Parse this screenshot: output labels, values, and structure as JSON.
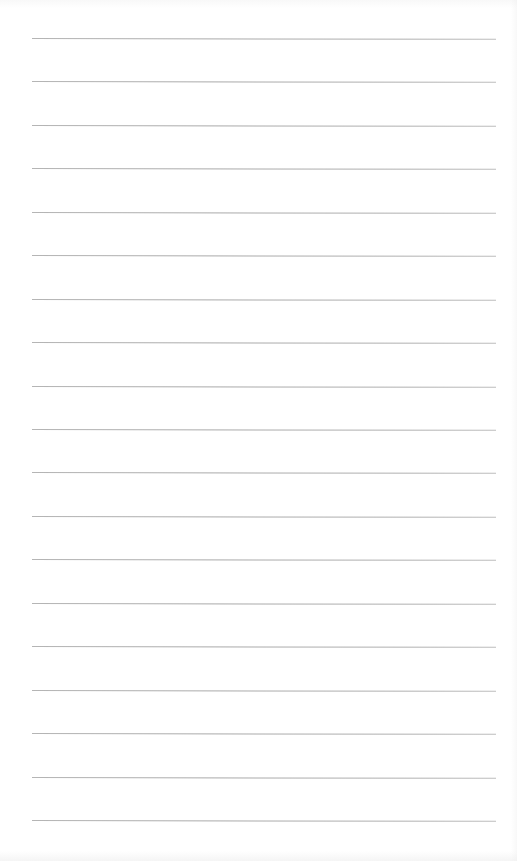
{
  "document": {
    "type": "lined-paper",
    "text_content": "",
    "rule_count": 19,
    "colors": {
      "paper": "#ffffff",
      "rule": "#a9a9a9"
    }
  }
}
